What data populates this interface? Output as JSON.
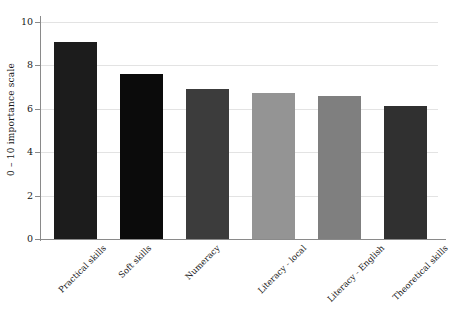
{
  "chart_data": {
    "type": "bar",
    "title": "",
    "subtitle": "",
    "xlabel": "",
    "ylabel": "0 – 10 importance scale",
    "ylim": [
      0,
      10
    ],
    "yticks": [
      0,
      2,
      4,
      6,
      8,
      10
    ],
    "ytick_labels": [
      "0",
      "2",
      "4",
      "6",
      "8",
      "10"
    ],
    "grid": "horizontal",
    "legend": "none",
    "categories": [
      "Practical skills",
      "Soft skills",
      "Numeracy",
      "Literacy - local",
      "Literacy - English",
      "Theoretical skills"
    ],
    "values": [
      9.1,
      7.6,
      6.9,
      6.75,
      6.6,
      6.15
    ],
    "bar_colors": [
      "#1c1c1c",
      "#0b0b0b",
      "#3c3c3c",
      "#949494",
      "#7f7f7f",
      "#303030"
    ],
    "axis_color": "#8a8a8a",
    "gridline_color": "#e3e3e3",
    "background_color": "#ffffff"
  },
  "axes": {
    "y_title": "0 – 10 importance scale"
  }
}
